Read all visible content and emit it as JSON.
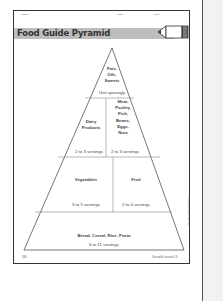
{
  "header": {
    "name_label": "Name",
    "date_label": "Date",
    "time_label": "Time",
    "title": "Food Guide Pyramid",
    "icon": "pencil-icon"
  },
  "pyramid": {
    "tiers": [
      {
        "group": "Fats, Oils, Sweets",
        "lines": [
          "Fats,",
          "Oils,",
          "Sweets"
        ],
        "servings": "Use sparingly"
      },
      {
        "group": "Dairy Products",
        "lines": [
          "Dairy",
          "Products"
        ],
        "servings": "2 to 3 servings"
      },
      {
        "group": "Meat, Poultry, Fish, Beans, Eggs, Nuts",
        "lines": [
          "Meat,",
          "Poultry,",
          "Fish,",
          "Beans,",
          "Eggs,",
          "Nuts"
        ],
        "servings": "2 to 3 servings"
      },
      {
        "group": "Vegetables",
        "lines": [
          "Vegetables"
        ],
        "servings": "3 to 5 servings"
      },
      {
        "group": "Fruit",
        "lines": [
          "Fruit"
        ],
        "servings": "2 to 4 servings"
      },
      {
        "group": "Bread, Cereal, Rice, Pasta",
        "lines": [
          "Bread, Cereal, Rice, Pasta"
        ],
        "servings": "6 to 11 servings"
      }
    ]
  },
  "footer": {
    "page_number": "184",
    "lesson_ref": "Use with Lesson 4.3",
    "side_credit": "© Houghton Mifflin Company"
  }
}
